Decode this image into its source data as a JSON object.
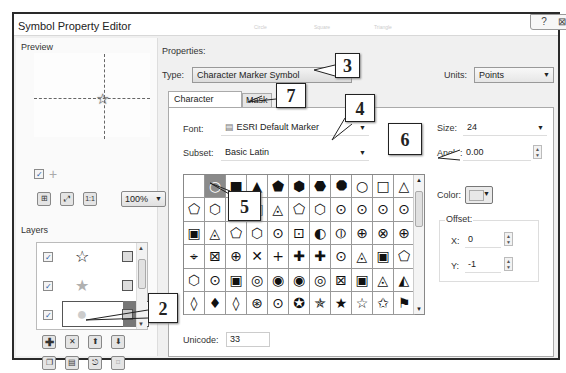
{
  "window": {
    "title": "Symbol Property Editor",
    "help_glyph": "?",
    "close_glyph": "⊠",
    "background_faded_labels": [
      "Circle",
      "Square",
      "Triangle"
    ]
  },
  "preview": {
    "label": "Preview",
    "symbol_icon": "star-outline-icon",
    "show_guides_checked": "✓",
    "crosshair_glyph": "+",
    "zoom_value": "100%",
    "buttons": [
      {
        "name": "fit-to-window-icon",
        "glyph": "⊞"
      },
      {
        "name": "expand-view-icon",
        "glyph": "⛶"
      },
      {
        "name": "actual-size-icon",
        "glyph": "1:1"
      }
    ]
  },
  "layers": {
    "label": "Layers",
    "items": [
      {
        "checked": "✓",
        "symbol": "☆",
        "color": "#111111",
        "lock": "▣"
      },
      {
        "checked": "✓",
        "symbol": "★",
        "color": "#b0b0b0",
        "lock": "▣"
      },
      {
        "checked": "✓",
        "symbol": "●",
        "color": "#cccccc",
        "lock": "▣",
        "selected": true
      }
    ],
    "actions_row1": [
      {
        "name": "add-layer-button",
        "glyph": "✚"
      },
      {
        "name": "remove-layer-button",
        "glyph": "✕"
      },
      {
        "name": "move-layer-up-button",
        "glyph": "⬆"
      },
      {
        "name": "move-layer-down-button",
        "glyph": "⬇"
      }
    ],
    "actions_row2": [
      {
        "name": "copy-layer-button",
        "glyph": "❐"
      },
      {
        "name": "paste-layer-button",
        "glyph": "▤"
      },
      {
        "name": "import-layer-button",
        "glyph": "⎋"
      },
      {
        "name": "tag-layer-button",
        "glyph": "⌑"
      }
    ]
  },
  "properties": {
    "label": "Properties:",
    "type_label": "Type:",
    "type_value": "Character Marker Symbol",
    "units_label": "Units:",
    "units_value": "Points",
    "tabs": [
      {
        "label": "Character Marker",
        "active": true
      },
      {
        "label": "Mask",
        "active": false
      }
    ],
    "font_label": "Font:",
    "font_value": "ESRI Default Marker",
    "subset_label": "Subset:",
    "subset_value": "Basic Latin",
    "size_label": "Size:",
    "size_value": "24",
    "angle_label": "Angle:",
    "angle_value": "0.00",
    "color_label": "Color:",
    "color_value": "#e8e8e8",
    "offset_label": "Offset:",
    "offset_x_label": "X:",
    "offset_x_value": "0",
    "offset_y_label": "Y:",
    "offset_y_value": "-1",
    "unicode_label": "Unicode:",
    "unicode_value": "33",
    "selected_cell_index": 1,
    "glyph_grid": [
      " ",
      "○",
      "■",
      "▲",
      "⬟",
      "⬢",
      "⬣",
      "⯃",
      "○",
      "□",
      "△",
      "⬠",
      "⬡",
      "⬡",
      "▣",
      "◬",
      "⬠",
      "⬡",
      "⊙",
      "⊙",
      "⊙",
      "⊙",
      "▣",
      "◬",
      "⬠",
      "⬡",
      "⊙",
      "⊡",
      "◐",
      "⦶",
      "⊕",
      "⊗",
      "⊕",
      "⌖",
      "⊠",
      "⊕",
      "✕",
      "+",
      "✚",
      "✚",
      "⊙",
      "◬",
      "▣",
      "⬠",
      "⬡",
      "⊙",
      "▣",
      "◎",
      "◉",
      "◉",
      "◎",
      "⊠",
      "▣",
      "◬",
      "◭",
      "◊",
      "♦",
      "◊",
      "⊛",
      "⊙",
      "✪",
      "✯",
      "★",
      "☆",
      "✩",
      "⚑"
    ]
  },
  "callouts": [
    {
      "label": "3"
    },
    {
      "label": "7"
    },
    {
      "label": "4"
    },
    {
      "label": "6"
    },
    {
      "label": "5"
    },
    {
      "label": "2"
    }
  ]
}
